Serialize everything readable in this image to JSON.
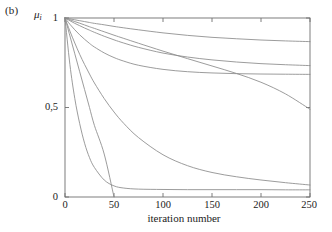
{
  "figure": {
    "panel_label": "(b)",
    "ylabel_symbol": "μ",
    "ylabel_subscript": "i",
    "xlabel": "iteration number"
  },
  "axes": {
    "x_ticks": [
      "0",
      "50",
      "100",
      "150",
      "200",
      "250"
    ],
    "y_ticks": [
      "0",
      "0,5",
      "1"
    ]
  },
  "chart_data": {
    "type": "line",
    "title": "",
    "subtitle": "",
    "panel": "(b)",
    "xlabel": "iteration number",
    "ylabel": "μ_i",
    "xlim": [
      0,
      250
    ],
    "ylim": [
      0,
      1
    ],
    "xticks": [
      0,
      50,
      100,
      150,
      200,
      250
    ],
    "yticks": [
      0,
      0.5,
      1
    ],
    "grid": false,
    "legend": "none",
    "line_color": "#8a8a8a",
    "x": [
      0,
      5,
      10,
      15,
      20,
      25,
      30,
      40,
      50,
      60,
      75,
      100,
      125,
      150,
      175,
      200,
      225,
      250
    ],
    "series": [
      {
        "name": "curve-1-slowest-decay",
        "values": [
          1.0,
          0.995,
          0.99,
          0.985,
          0.98,
          0.975,
          0.97,
          0.962,
          0.953,
          0.945,
          0.934,
          0.917,
          0.903,
          0.892,
          0.884,
          0.877,
          0.872,
          0.868
        ]
      },
      {
        "name": "curve-2-slow-decay",
        "values": [
          1.0,
          0.985,
          0.97,
          0.957,
          0.944,
          0.932,
          0.92,
          0.898,
          0.878,
          0.86,
          0.836,
          0.804,
          0.782,
          0.766,
          0.754,
          0.745,
          0.739,
          0.734
        ]
      },
      {
        "name": "curve-3-moderate-decay",
        "values": [
          1.0,
          0.965,
          0.934,
          0.906,
          0.881,
          0.858,
          0.838,
          0.805,
          0.779,
          0.759,
          0.736,
          0.713,
          0.7,
          0.693,
          0.689,
          0.687,
          0.686,
          0.685
        ]
      },
      {
        "name": "curve-4-near-linear-decay",
        "values": [
          1.0,
          0.99,
          0.98,
          0.971,
          0.961,
          0.951,
          0.942,
          0.923,
          0.904,
          0.886,
          0.859,
          0.815,
          0.773,
          0.732,
          0.69,
          0.641,
          0.576,
          0.49
        ]
      },
      {
        "name": "curve-5-medium-fast-decay",
        "values": [
          1.0,
          0.927,
          0.86,
          0.797,
          0.74,
          0.687,
          0.637,
          0.55,
          0.475,
          0.411,
          0.332,
          0.236,
          0.175,
          0.137,
          0.113,
          0.095,
          0.08,
          0.067
        ]
      },
      {
        "name": "curve-6-fast-decay-to-floor",
        "values": [
          1.0,
          0.74,
          0.55,
          0.41,
          0.3,
          0.22,
          0.165,
          0.095,
          0.062,
          0.05,
          0.044,
          0.042,
          0.041,
          0.041,
          0.041,
          0.041,
          0.04,
          0.04
        ]
      },
      {
        "name": "curve-7-fastest-decay-to-zero",
        "values": [
          1.0,
          0.9,
          0.8,
          0.7,
          0.6,
          0.5,
          0.4,
          0.24,
          0.0,
          null,
          null,
          null,
          null,
          null,
          null,
          null,
          null,
          null
        ]
      }
    ],
    "notes": {
      "curve_4_crossing": "curve-4 crosses curve-3 near iteration 160 at μ ≈ 0.70",
      "curve_7_endpoint": "curve-7 reaches 0 at iteration 50",
      "curve_6_floor": "curve-6 levels off near μ ≈ 0.04"
    }
  }
}
